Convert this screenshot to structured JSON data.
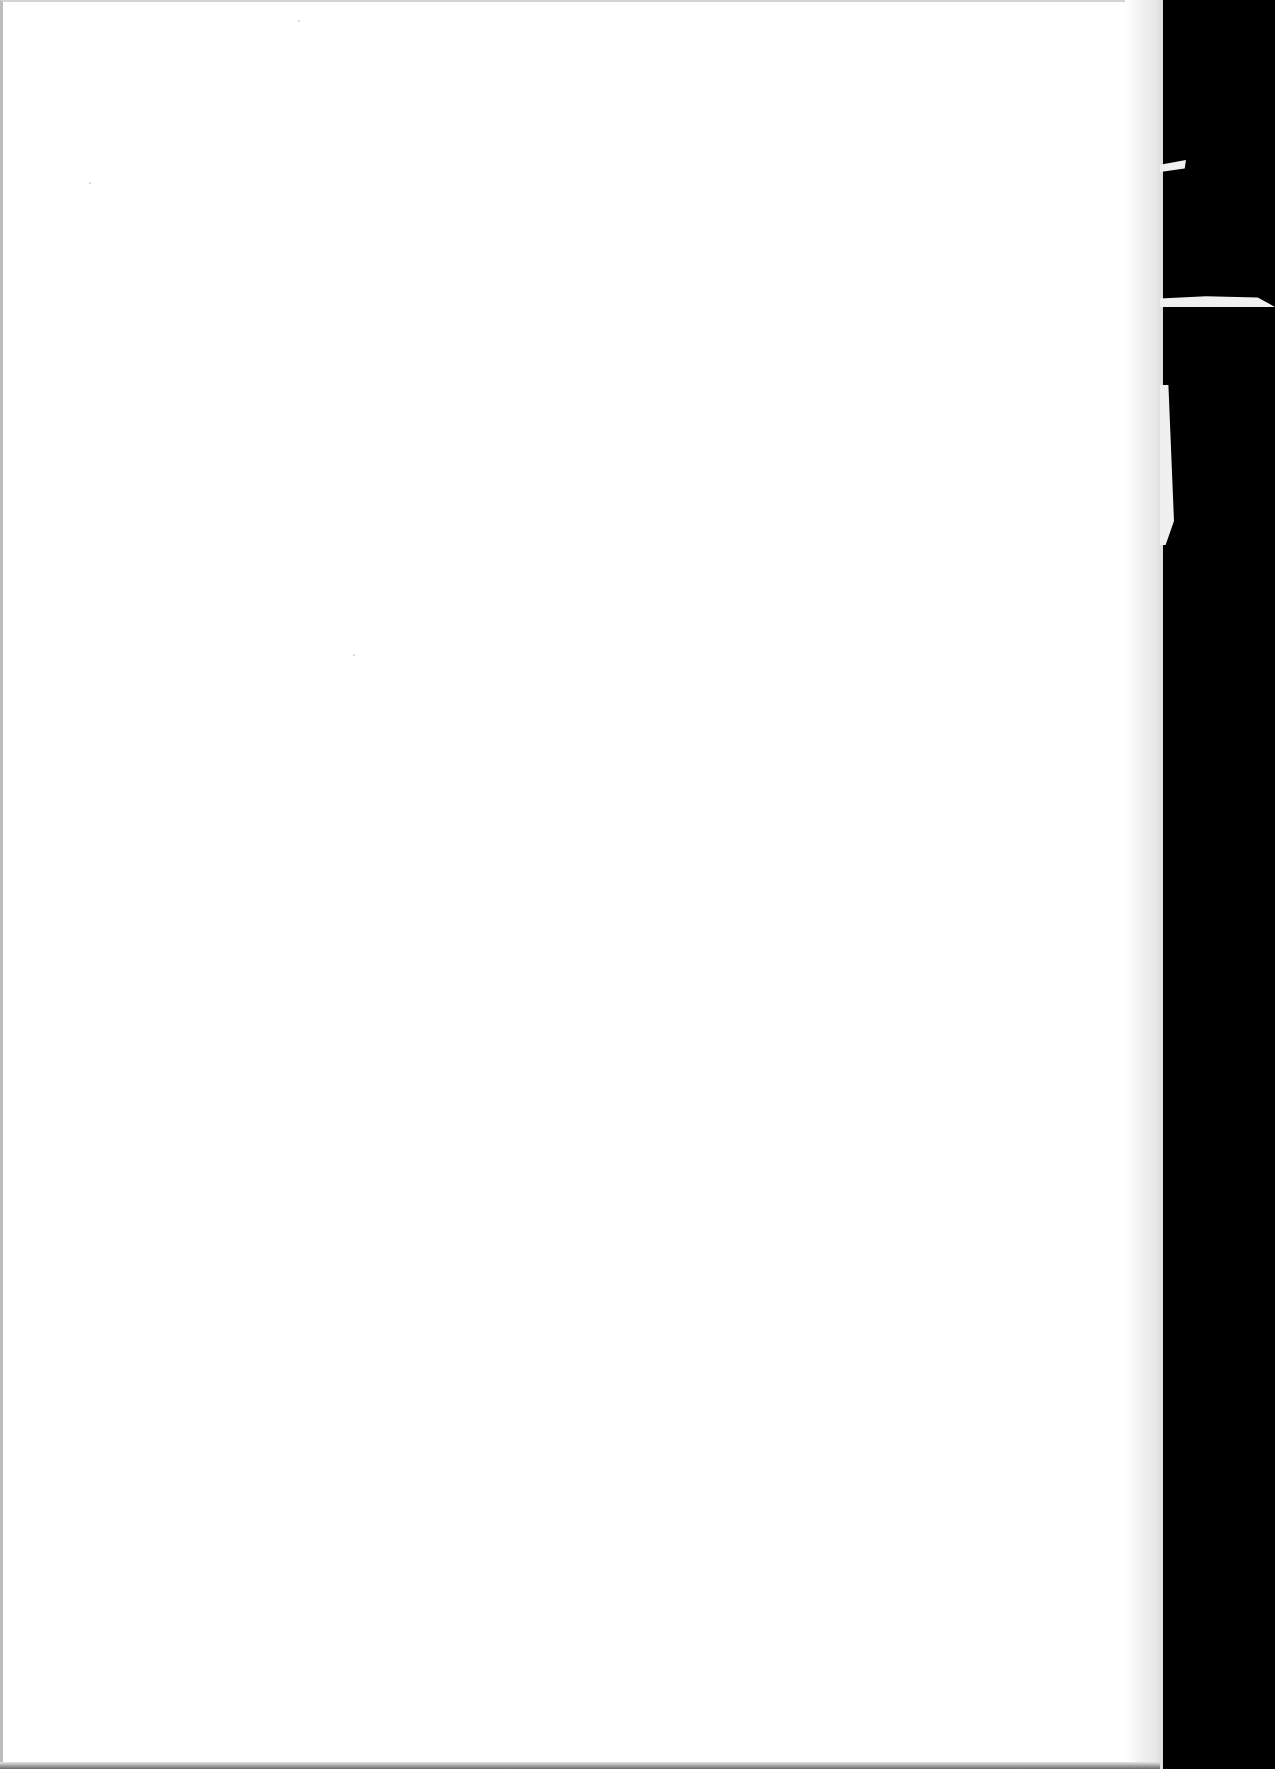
{
  "document": {
    "type": "scanned-page",
    "content": "",
    "colors": {
      "paper": "#ffffff",
      "background": "#000000",
      "page_edge": "#e6e6e6"
    }
  }
}
